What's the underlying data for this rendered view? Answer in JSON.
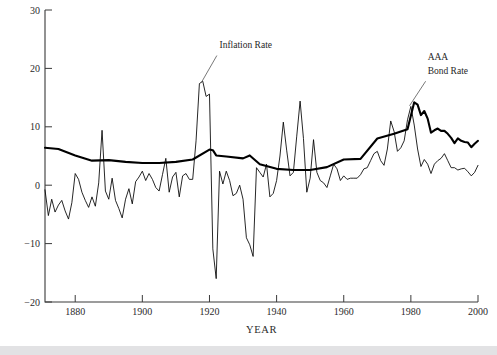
{
  "chart_data": {
    "type": "line",
    "title": "",
    "xlabel": "YEAR",
    "ylabel": "PERCENT",
    "xlim": [
      1871,
      2000
    ],
    "ylim": [
      -20,
      30
    ],
    "xticks": [
      1880,
      1900,
      1920,
      1940,
      1960,
      1980,
      2000
    ],
    "xtick_labels": [
      "1880",
      "1900",
      "1920",
      "1940",
      "1960",
      "1980",
      "2000"
    ],
    "yticks": [
      -20,
      -10,
      0,
      10,
      20,
      30
    ],
    "ytick_labels": [
      "−20",
      "−10",
      "0",
      "10",
      "20",
      "30"
    ],
    "grid": false,
    "legend": "annotations",
    "annotations": [
      {
        "text": "Inflation Rate",
        "x": 1923,
        "y": 23.5
      },
      {
        "text": "AAA",
        "x": 1985,
        "y": 21.5
      },
      {
        "text": "Bond Rate",
        "x": 1985,
        "y": 19.0
      }
    ],
    "series": [
      {
        "name": "Inflation Rate",
        "style": "thin",
        "x": [
          1871,
          1872,
          1873,
          1874,
          1875,
          1876,
          1877,
          1878,
          1879,
          1880,
          1881,
          1882,
          1883,
          1884,
          1885,
          1886,
          1887,
          1888,
          1889,
          1890,
          1891,
          1892,
          1893,
          1894,
          1895,
          1896,
          1897,
          1898,
          1899,
          1900,
          1901,
          1902,
          1903,
          1904,
          1905,
          1906,
          1907,
          1908,
          1909,
          1910,
          1911,
          1912,
          1913,
          1914,
          1915,
          1916,
          1917,
          1918,
          1919,
          1920,
          1921,
          1922,
          1923,
          1924,
          1925,
          1926,
          1927,
          1928,
          1929,
          1930,
          1931,
          1932,
          1933,
          1934,
          1935,
          1936,
          1937,
          1938,
          1939,
          1940,
          1941,
          1942,
          1943,
          1944,
          1945,
          1946,
          1947,
          1948,
          1949,
          1950,
          1951,
          1952,
          1953,
          1954,
          1955,
          1956,
          1957,
          1958,
          1959,
          1960,
          1961,
          1962,
          1963,
          1964,
          1965,
          1966,
          1967,
          1968,
          1969,
          1970,
          1971,
          1972,
          1973,
          1974,
          1975,
          1976,
          1977,
          1978,
          1979,
          1980,
          1981,
          1982,
          1983,
          1984,
          1985,
          1986,
          1987,
          1988,
          1989,
          1990,
          1991,
          1992,
          1993,
          1994,
          1995,
          1996,
          1997,
          1998,
          1999,
          2000
        ],
        "y": [
          -0.8,
          -5.2,
          -2.4,
          -4.6,
          -3.4,
          -2.6,
          -4.4,
          -5.8,
          -3.0,
          2.0,
          1.0,
          -1.2,
          -2.6,
          -3.8,
          -2.0,
          -3.6,
          0.4,
          9.4,
          -1.0,
          -2.4,
          1.2,
          -2.6,
          -4.0,
          -5.6,
          -2.4,
          -0.6,
          -3.2,
          0.6,
          1.4,
          2.4,
          0.8,
          2.0,
          1.0,
          -0.4,
          -1.0,
          1.8,
          4.6,
          -1.2,
          1.4,
          2.2,
          -2.0,
          1.6,
          2.0,
          1.0,
          1.0,
          7.6,
          17.4,
          17.8,
          15.2,
          15.6,
          -10.9,
          -16.0,
          2.4,
          0.2,
          2.4,
          0.8,
          -1.8,
          -1.4,
          0.0,
          -2.4,
          -9.0,
          -10.2,
          -12.2,
          3.0,
          2.2,
          1.4,
          3.6,
          -2.0,
          -1.4,
          0.8,
          5.0,
          10.8,
          6.0,
          1.6,
          2.2,
          8.4,
          14.4,
          8.0,
          -1.2,
          1.2,
          7.8,
          2.2,
          0.8,
          0.4,
          -0.4,
          1.6,
          3.6,
          2.8,
          0.8,
          1.6,
          1.0,
          1.2,
          1.2,
          1.2,
          1.8,
          2.8,
          3.0,
          4.2,
          5.4,
          5.8,
          4.2,
          3.4,
          6.2,
          11.0,
          9.2,
          5.8,
          6.4,
          7.6,
          11.2,
          13.5,
          10.3,
          6.2,
          3.2,
          4.4,
          3.6,
          2.0,
          3.6,
          4.2,
          4.6,
          5.4,
          4.2,
          3.0,
          3.0,
          2.6,
          2.8,
          2.9,
          2.3,
          1.6,
          2.2,
          3.4
        ]
      },
      {
        "name": "AAA Bond Rate",
        "style": "thick",
        "x": [
          1871,
          1875,
          1880,
          1885,
          1890,
          1895,
          1900,
          1905,
          1910,
          1915,
          1920,
          1921,
          1922,
          1925,
          1930,
          1932,
          1935,
          1940,
          1945,
          1950,
          1955,
          1960,
          1965,
          1970,
          1975,
          1979,
          1980,
          1981,
          1982,
          1983,
          1984,
          1985,
          1986,
          1987,
          1988,
          1989,
          1990,
          1991,
          1992,
          1993,
          1994,
          1995,
          1996,
          1997,
          1998,
          1999,
          2000
        ],
        "y": [
          6.4,
          6.2,
          5.1,
          4.2,
          4.3,
          4.0,
          3.8,
          3.8,
          4.0,
          4.4,
          6.1,
          6.0,
          5.1,
          4.9,
          4.6,
          5.1,
          3.6,
          2.8,
          2.6,
          2.6,
          3.1,
          4.4,
          4.5,
          8.0,
          8.8,
          9.6,
          11.9,
          14.2,
          13.8,
          12.0,
          12.7,
          11.4,
          9.0,
          9.4,
          9.7,
          9.3,
          9.3,
          8.8,
          8.1,
          7.2,
          8.0,
          7.6,
          7.4,
          7.3,
          6.5,
          7.1,
          7.6
        ]
      }
    ]
  },
  "labels": {
    "ylabel": "PERCENT",
    "xlabel": "YEAR",
    "inflation": "Inflation Rate",
    "aaa_line1": "AAA",
    "aaa_line2": "Bond Rate"
  }
}
